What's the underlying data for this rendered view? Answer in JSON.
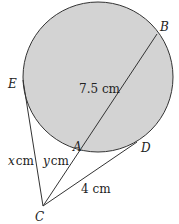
{
  "diagram": {
    "colors": {
      "circle_fill": "#d3d3d3",
      "stroke": "#333333"
    },
    "points": {
      "B": "B",
      "E": "E",
      "A": "A",
      "D": "D",
      "C": "C"
    },
    "labels": {
      "AB": "7.5 cm",
      "CE_var": "x",
      "CE_unit": "cm",
      "CA_var": "y",
      "CA_unit": "cm",
      "CD": "4 cm"
    }
  }
}
